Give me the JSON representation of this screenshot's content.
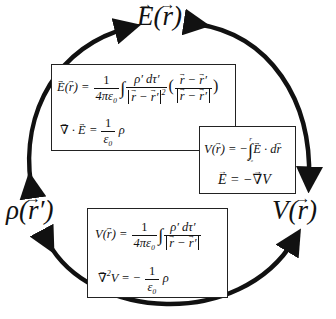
{
  "diagram": {
    "nodes": {
      "field": {
        "label": "E(r)",
        "symbol": "E",
        "arg": "r"
      },
      "charge": {
        "label": "ρ(r′)",
        "symbol": "ρ",
        "arg": "r′"
      },
      "potential": {
        "label": "V(r)",
        "symbol": "V",
        "arg": "r"
      }
    },
    "boxes": {
      "charge_field": {
        "eq1": {
          "lhs": "E(r) =",
          "num": "1",
          "den": "4πε₀",
          "integrand_num": "ρ′ dτ′",
          "integrand_den": "|r − r′|²",
          "unit_num": "r − r′",
          "unit_den": "|r − r′|"
        },
        "eq2": {
          "lhs": "∇ · E =",
          "num": "1",
          "den": "ε₀",
          "rhs": "ρ"
        }
      },
      "field_potential": {
        "eq1": {
          "lhs": "V(r) = −",
          "upper": "r",
          "lower": "r₀",
          "integrand": "E · dr"
        },
        "eq2": {
          "text": "E = −∇V"
        }
      },
      "charge_potential": {
        "eq1": {
          "lhs": "V(r) =",
          "num": "1",
          "den": "4πε₀",
          "integrand_num": "ρ′ dτ′",
          "integrand_den": "|r − r′|"
        },
        "eq2": {
          "lhs": "∇²V = −",
          "num": "1",
          "den": "ε₀",
          "rhs": "ρ"
        }
      }
    },
    "arrows": [
      {
        "from": "charge",
        "to": "field",
        "bidirectional": true,
        "path": "left arc"
      },
      {
        "from": "field",
        "to": "potential",
        "bidirectional": true,
        "path": "right arc"
      },
      {
        "from": "charge",
        "to": "potential",
        "bidirectional": true,
        "path": "bottom arc"
      }
    ],
    "colors": {
      "stroke": "#111111",
      "background": "#ffffff",
      "box_border": "#222222"
    }
  }
}
